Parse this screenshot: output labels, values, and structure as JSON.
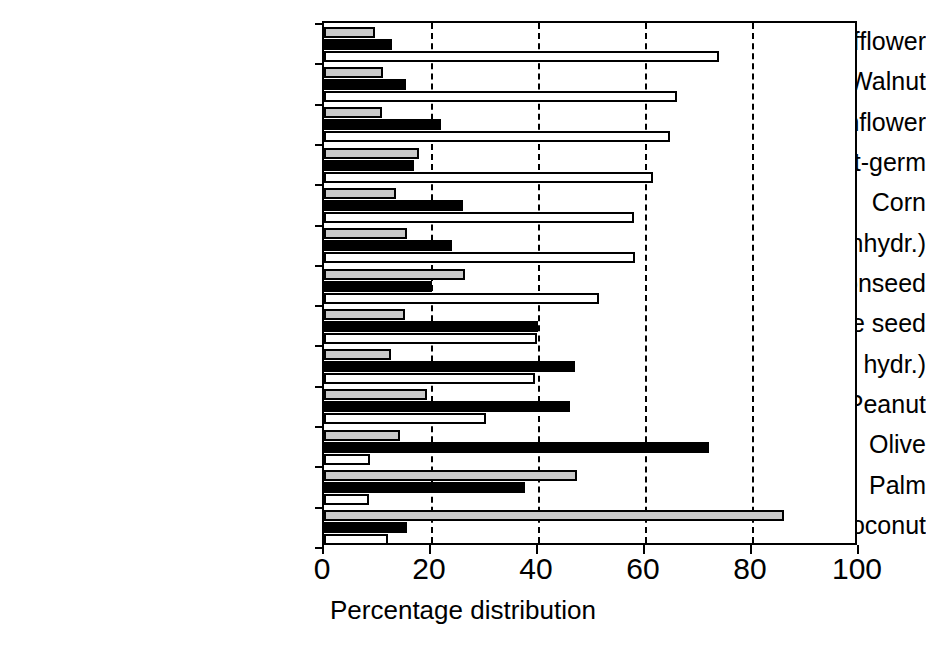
{
  "chart_data": {
    "type": "bar",
    "orientation": "horizontal",
    "title": "",
    "xlabel": "Percentage distribution",
    "ylabel": "",
    "xlim": [
      0,
      100
    ],
    "xticks": [
      0,
      20,
      40,
      60,
      80,
      100
    ],
    "xtick_labels": [
      "0",
      "20",
      "40",
      "60",
      "80",
      "100"
    ],
    "grid": "vertical-dashed",
    "legend": "none",
    "categories": [
      "Safflower",
      "Walnut",
      "Sunflower",
      "Wheat-germ",
      "Corn",
      "Soybean (unhydr.)",
      "Cottonseed",
      "Sesame seed",
      "Soybean (part. hydr.)",
      "Peanut",
      "Olive",
      "Palm",
      "Coconut"
    ],
    "series": [
      {
        "name": "Saturated",
        "fill": "gray",
        "color": "#c9c9c9",
        "values": [
          9.5,
          11.0,
          10.8,
          17.8,
          13.5,
          15.6,
          26.4,
          15.2,
          12.5,
          19.2,
          14.2,
          47.3,
          86.0
        ]
      },
      {
        "name": "Monounsaturated",
        "fill": "black",
        "color": "#000000",
        "values": [
          12.7,
          15.3,
          21.9,
          16.8,
          26.0,
          24.0,
          20.2,
          40.0,
          47.0,
          46.0,
          72.0,
          37.6,
          15.5
        ]
      },
      {
        "name": "Polyunsaturated",
        "fill": "white",
        "color": "#ffffff",
        "values": [
          73.8,
          66.0,
          64.7,
          61.5,
          58.0,
          58.1,
          51.4,
          39.8,
          39.4,
          30.3,
          8.6,
          8.4,
          12.0
        ]
      }
    ]
  }
}
